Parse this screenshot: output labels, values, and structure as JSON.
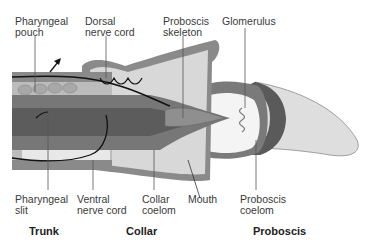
{
  "diagram": {
    "top_labels": [
      {
        "id": "pharyngeal-pouch",
        "text": "Pharyngeal\npouch"
      },
      {
        "id": "dorsal-nerve-cord",
        "text": "Dorsal\nnerve cord"
      },
      {
        "id": "proboscis-skeleton",
        "text": "Proboscis\nskeleton"
      },
      {
        "id": "glomerulus",
        "text": "Glomerulus"
      }
    ],
    "bottom_labels": [
      {
        "id": "pharyngeal-slit",
        "text": "Pharyngeal\nslit"
      },
      {
        "id": "ventral-nerve-cord",
        "text": "Ventral\nnerve cord"
      },
      {
        "id": "collar-coelom",
        "text": "Collar\ncoelom"
      },
      {
        "id": "mouth",
        "text": "Mouth"
      },
      {
        "id": "proboscis-coelom",
        "text": "Proboscis\ncoelom"
      }
    ],
    "regions": [
      {
        "id": "trunk",
        "text": "Trunk"
      },
      {
        "id": "collar",
        "text": "Collar"
      },
      {
        "id": "proboscis",
        "text": "Proboscis"
      }
    ],
    "colors": {
      "dark_tissue": "#6e6e6e",
      "mid_tissue": "#9a9a9a",
      "light_tissue": "#c8c8c8",
      "pale_tissue": "#e2e2e2",
      "line": "#1a1a1a"
    }
  }
}
